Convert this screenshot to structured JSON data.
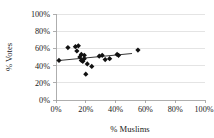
{
  "chart_data": {
    "type": "scatter",
    "title": "",
    "xlabel": "% Muslims",
    "ylabel": "% Votes",
    "xlim": [
      0,
      100
    ],
    "ylim": [
      0,
      100
    ],
    "grid": true,
    "legend": false,
    "xticks": [
      "0%",
      "20%",
      "40%",
      "60%",
      "80%",
      "100%"
    ],
    "yticks": [
      "0%",
      "20%",
      "40%",
      "60%",
      "80%",
      "100%"
    ],
    "xtick_values": [
      0,
      20,
      40,
      60,
      80,
      100
    ],
    "ytick_values": [
      0,
      20,
      40,
      60,
      80,
      100
    ],
    "series": [
      {
        "name": "constituencies",
        "marker": "diamond",
        "color": "#111111",
        "points": [
          {
            "x": 2,
            "y": 46
          },
          {
            "x": 8,
            "y": 61
          },
          {
            "x": 13,
            "y": 62
          },
          {
            "x": 14,
            "y": 57
          },
          {
            "x": 15,
            "y": 63
          },
          {
            "x": 16,
            "y": 50
          },
          {
            "x": 17,
            "y": 46
          },
          {
            "x": 17,
            "y": 53
          },
          {
            "x": 18,
            "y": 45
          },
          {
            "x": 19,
            "y": 52
          },
          {
            "x": 19,
            "y": 48
          },
          {
            "x": 20,
            "y": 30
          },
          {
            "x": 21,
            "y": 42
          },
          {
            "x": 24,
            "y": 39
          },
          {
            "x": 29,
            "y": 51
          },
          {
            "x": 31,
            "y": 52
          },
          {
            "x": 33,
            "y": 47
          },
          {
            "x": 36,
            "y": 48
          },
          {
            "x": 41,
            "y": 53
          },
          {
            "x": 42,
            "y": 52
          },
          {
            "x": 55,
            "y": 58
          }
        ]
      }
    ],
    "trendline": {
      "name": "linear-fit",
      "color": "#3a3a3a",
      "x_start": 2,
      "y_start": 46,
      "x_end": 51,
      "y_end": 54
    }
  }
}
